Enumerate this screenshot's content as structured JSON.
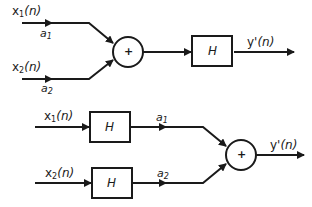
{
  "diagram": {
    "type": "block-diagram",
    "topic": "linearity of system H (superposition)",
    "colors": {
      "stroke": "#1a1a1a",
      "background": "#ffffff"
    },
    "top": {
      "inputs": [
        {
          "name": "x",
          "sub": "1",
          "arg": "(n)",
          "coef": "a",
          "coef_sub": "1"
        },
        {
          "name": "x",
          "sub": "2",
          "arg": "(n)",
          "coef": "a",
          "coef_sub": "2"
        }
      ],
      "summer": {
        "symbol": "+"
      },
      "block": {
        "label": "H"
      },
      "output": {
        "name": "y'",
        "arg": "(n)"
      }
    },
    "bottom": {
      "inputs": [
        {
          "name": "x",
          "sub": "1",
          "arg": "(n)",
          "block": "H",
          "coef": "a",
          "coef_sub": "1"
        },
        {
          "name": "x",
          "sub": "2",
          "arg": "(n)",
          "block": "H",
          "coef": "a",
          "coef_sub": "2"
        }
      ],
      "summer": {
        "symbol": "+"
      },
      "output": {
        "name": "y'",
        "arg": "(n)"
      }
    }
  }
}
